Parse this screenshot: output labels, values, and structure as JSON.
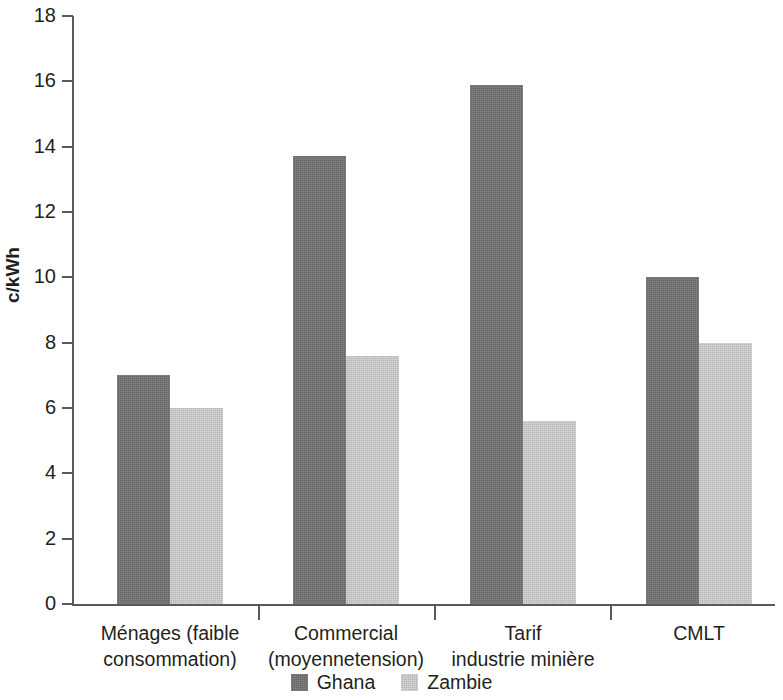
{
  "chart_data": {
    "type": "bar",
    "title": "",
    "xlabel": "",
    "ylabel": "c/kWh",
    "ylim": [
      0,
      18
    ],
    "ytick_step": 2,
    "yticks": [
      "18",
      "16",
      "14",
      "12",
      "10",
      "8",
      "6",
      "4",
      "2",
      "0"
    ],
    "grid": false,
    "legend_position": "bottom-center",
    "categories": [
      "Ménages (faible consommation)",
      "Commercial (moyennetension)",
      "Tarif industrie minière",
      "CMLT"
    ],
    "category_lines": [
      [
        "Ménages (faible",
        "consommation)"
      ],
      [
        "Commercial",
        "(moyennetension)"
      ],
      [
        "Tarif",
        "industrie minière"
      ],
      [
        "CMLT",
        ""
      ]
    ],
    "series": [
      {
        "name": "Ghana",
        "color": "#737373",
        "values": [
          7.0,
          13.7,
          15.9,
          10.0
        ]
      },
      {
        "name": "Zambie",
        "color": "#cccccc",
        "values": [
          6.0,
          7.6,
          5.6,
          8.0
        ]
      }
    ]
  },
  "legend": {
    "items": [
      {
        "label": "Ghana",
        "swatch_color": "#737373"
      },
      {
        "label": "Zambie",
        "swatch_color": "#cccccc"
      }
    ]
  },
  "axis": {
    "line_color": "#58595b"
  }
}
